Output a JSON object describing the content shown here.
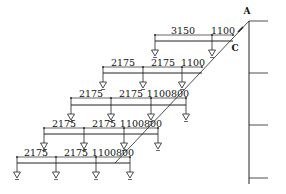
{
  "diagram": {
    "title": "",
    "points": [
      {
        "name": "A",
        "label": "A",
        "x": 247,
        "y": 14
      },
      {
        "name": "C",
        "label": "C",
        "x": 235,
        "y": 51
      }
    ],
    "rows": [
      {
        "dim_y": 35,
        "beam_y": 41,
        "x_start": 155,
        "x_end": 233,
        "supports": [
          155,
          212
        ],
        "dims": [
          {
            "label": "3150",
            "x": 183
          },
          {
            "label": "1100",
            "x": 223
          }
        ]
      },
      {
        "dim_y": 67,
        "beam_y": 73,
        "x_start": 103,
        "x_end": 202,
        "supports": [
          103,
          143,
          182
        ],
        "dims": [
          {
            "label": "2175",
            "x": 123
          },
          {
            "label": "2175",
            "x": 163
          },
          {
            "label": "1100",
            "x": 193
          }
        ]
      },
      {
        "dim_y": 98,
        "beam_y": 105,
        "x_start": 71,
        "x_end": 186,
        "supports": [
          71,
          111,
          151,
          186
        ],
        "dims": [
          {
            "label": "2175",
            "x": 91
          },
          {
            "label": "2175",
            "x": 131
          },
          {
            "label": "1100800",
            "x": 168
          }
        ]
      },
      {
        "dim_y": 128,
        "beam_y": 134,
        "x_start": 44,
        "x_end": 158,
        "supports": [
          44,
          84,
          124,
          158
        ],
        "dims": [
          {
            "label": "2175",
            "x": 64
          },
          {
            "label": "2175",
            "x": 104
          },
          {
            "label": "1100800",
            "x": 141
          }
        ]
      },
      {
        "dim_y": 157,
        "beam_y": 163,
        "x_start": 17,
        "x_end": 130,
        "supports": [
          17,
          56,
          96,
          130
        ],
        "dims": [
          {
            "label": "2175",
            "x": 36
          },
          {
            "label": "2175",
            "x": 76
          },
          {
            "label": "1100800",
            "x": 113
          }
        ]
      }
    ],
    "diagonal": {
      "x1": 115,
      "y1": 163,
      "x2": 249,
      "y2": 21
    },
    "column": {
      "x": 249,
      "y1": 21,
      "y2": 184,
      "ticks_y": [
        21,
        73,
        125,
        178
      ],
      "tick_x_end": 268
    },
    "colors": {
      "line": "#222222",
      "text": "#111111"
    }
  }
}
